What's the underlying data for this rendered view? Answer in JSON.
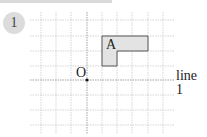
{
  "problem": {
    "number": "1"
  },
  "figure": {
    "point_label": "O",
    "shape_label": "A",
    "line_label": "line 1",
    "colors": {
      "grid": "#bdbdbd",
      "shape_fill": "#e3e3e3",
      "shape_stroke": "#555555",
      "axis": "#888888"
    }
  }
}
